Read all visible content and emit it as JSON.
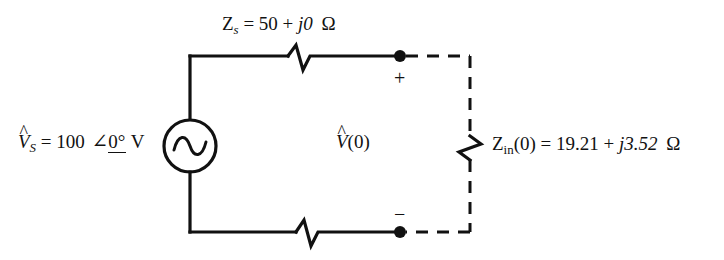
{
  "figure": {
    "background_color": "#ffffff",
    "line_color": "#111111"
  },
  "labels": {
    "source": {
      "symbol": "V",
      "hat": "^",
      "subscript": "S",
      "equals": "=",
      "magnitude": "100",
      "angle_glyph": "∠",
      "angle_value": "0°",
      "unit": "V",
      "full_text": "V̂S = 100 ∠0° V"
    },
    "series_impedance": {
      "symbol": "Z",
      "subscript": "s",
      "equals": "=",
      "real": "50",
      "plus": "+",
      "imag": "j0",
      "unit": "Ω",
      "full_text": "Zs = 50 + j0 Ω"
    },
    "output_voltage": {
      "symbol": "V",
      "hat": "^",
      "argument": "(0)",
      "full_text": "V̂(0)"
    },
    "input_impedance": {
      "symbol": "Z",
      "subscript": "in",
      "argument": "(0)",
      "equals": "=",
      "real": "19.21",
      "plus": "+",
      "imag": "j3.52",
      "unit": "Ω",
      "full_text": "Zin(0) = 19.21 + j3.52 Ω"
    },
    "terminal_plus": "+",
    "terminal_minus": "−"
  },
  "components": {
    "ac_source": "ac-voltage-source",
    "series_resistor": "series-impedance-zigzag",
    "bottom_resistor": "bottom-wire-zigzag",
    "load_resistor": "input-impedance-zigzag",
    "terminal_top": "terminal-node-positive",
    "terminal_bottom": "terminal-node-negative"
  }
}
